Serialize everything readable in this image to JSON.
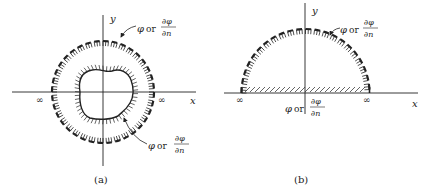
{
  "figure": {
    "panels": [
      {
        "id": "a",
        "caption": "(a)",
        "axis_x_label": "x",
        "axis_y_label": "y",
        "infinity_left": "∞",
        "infinity_right": "∞",
        "outer_label": {
          "phi": "φ",
          "or": "or",
          "num": "∂φ",
          "den": "∂n"
        },
        "inner_label": {
          "phi": "φ",
          "or": "or",
          "num": "∂φ",
          "den": "∂n"
        }
      },
      {
        "id": "b",
        "caption": "(b)",
        "axis_x_label": "x",
        "axis_y_label": "y",
        "infinity_left": "∞",
        "infinity_right": "∞",
        "arc_label": {
          "phi": "φ",
          "or": "or",
          "num": "∂φ",
          "den": "∂n"
        },
        "boundary_label": {
          "phi": "φ",
          "or": "or",
          "num": "∂φ",
          "den": "∂n"
        }
      }
    ],
    "colors": {
      "ink": "#222222",
      "background": "#ffffff"
    }
  }
}
